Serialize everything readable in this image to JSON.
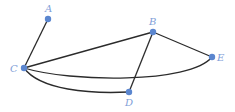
{
  "graph": {
    "node_color": "#5b86cf",
    "label_color": "#7fa0d8",
    "edge_color": "#2b2b2b",
    "nodes": [
      {
        "id": "A",
        "label": "A",
        "x": 48,
        "y": 19,
        "lx": 45,
        "ly": 12
      },
      {
        "id": "B",
        "label": "B",
        "x": 153,
        "y": 32,
        "lx": 149,
        "ly": 25
      },
      {
        "id": "C",
        "label": "C",
        "x": 24,
        "y": 68,
        "lx": 10,
        "ly": 72
      },
      {
        "id": "D",
        "label": "D",
        "x": 129,
        "y": 92,
        "lx": 125,
        "ly": 106
      },
      {
        "id": "E",
        "label": "E",
        "x": 212,
        "y": 57,
        "lx": 217,
        "ly": 61
      }
    ],
    "edges": [
      {
        "from": "A",
        "to": "C",
        "type": "straight"
      },
      {
        "from": "C",
        "to": "B",
        "type": "straight"
      },
      {
        "from": "B",
        "to": "E",
        "type": "straight"
      },
      {
        "from": "B",
        "to": "D",
        "type": "straight"
      },
      {
        "from": "C",
        "to": "E",
        "type": "curved"
      },
      {
        "from": "C",
        "to": "D",
        "type": "curved"
      }
    ]
  }
}
